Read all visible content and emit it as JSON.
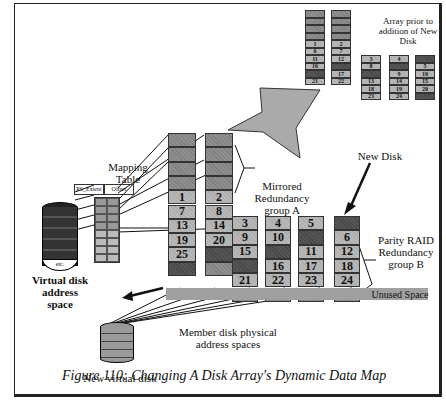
{
  "labels": {
    "array_prior": "Array prior to addition of New Disk",
    "mapping_table": "Mapping Table",
    "col_extent": "PS_Extent",
    "col_offset": "Offset",
    "virtual_disk": "Virtual disk address space",
    "virtual_disk_etc": "etc.",
    "mirrored_group": "Mirrored Redundancy group A",
    "new_disk": "New Disk",
    "parity_group": "Parity RAID Redundancy group B",
    "unused_space": "Unused Space",
    "member_disk": "Member disk physical address spaces",
    "new_virtual_disk": "New virtual disk",
    "caption": "Figure 110: Changing A Disk Array's Dynamic Data Map"
  },
  "prior_array": {
    "columns": [
      [
        "m",
        "m",
        "m",
        "m",
        "1",
        "6",
        "11",
        "16",
        "d",
        "21"
      ],
      [
        "m",
        "m",
        "m",
        "m",
        "2",
        "7",
        "12",
        "d",
        "17",
        "22"
      ],
      [
        "3",
        "8",
        "d",
        "13",
        "18",
        "23"
      ],
      [
        "4",
        "d",
        "9",
        "14",
        "19",
        "24"
      ],
      [
        "d",
        "5",
        "10",
        "15",
        "20",
        "d"
      ]
    ]
  },
  "main_array": {
    "mirror_cols": [
      [
        "m",
        "m",
        "m",
        "m",
        "1",
        "7",
        "13",
        "19",
        "25",
        "d"
      ],
      [
        "m",
        "m",
        "m",
        "m",
        "2",
        "8",
        "14",
        "20",
        "d",
        "u"
      ]
    ],
    "parity_cols": [
      [
        "3",
        "9",
        "15",
        "d",
        "21",
        "u"
      ],
      [
        "4",
        "10",
        "d",
        "16",
        "22",
        "u"
      ],
      [
        "5",
        "d",
        "11",
        "17",
        "23",
        "u"
      ],
      [
        "d",
        "6",
        "12",
        "18",
        "24",
        "u"
      ]
    ]
  }
}
